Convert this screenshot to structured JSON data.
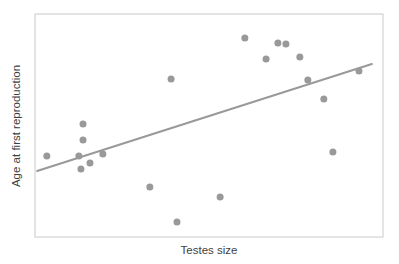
{
  "figure": {
    "background": "#ffffff",
    "border_color": "#cacaca",
    "point_color": "#999999",
    "line_color": "#999999",
    "text_color": "#3f3f3f"
  },
  "chart_data": {
    "type": "scatter",
    "title": "",
    "xlabel": "Testes size",
    "ylabel": "Age at first reproduction",
    "xlim": [
      0,
      100
    ],
    "ylim": [
      0,
      100
    ],
    "grid": false,
    "axis_ticks": "none",
    "legend": "none",
    "points": [
      [
        60.3,
        89.2
      ],
      [
        69.8,
        87.0
      ],
      [
        72.1,
        86.5
      ],
      [
        66.4,
        79.8
      ],
      [
        76.1,
        80.7
      ],
      [
        39.1,
        70.9
      ],
      [
        78.4,
        70.4
      ],
      [
        93.1,
        74.4
      ],
      [
        83.0,
        61.9
      ],
      [
        13.8,
        50.7
      ],
      [
        13.8,
        43.5
      ],
      [
        3.4,
        36.3
      ],
      [
        12.6,
        36.3
      ],
      [
        19.5,
        37.2
      ],
      [
        15.8,
        33.2
      ],
      [
        13.2,
        30.5
      ],
      [
        33.0,
        22.4
      ],
      [
        85.6,
        38.1
      ],
      [
        53.2,
        17.9
      ],
      [
        40.8,
        6.7
      ]
    ],
    "point_radius": 3.5,
    "trend_line": {
      "x1": 0.6,
      "y1": 29.6,
      "x2": 96.8,
      "y2": 77.6
    }
  }
}
